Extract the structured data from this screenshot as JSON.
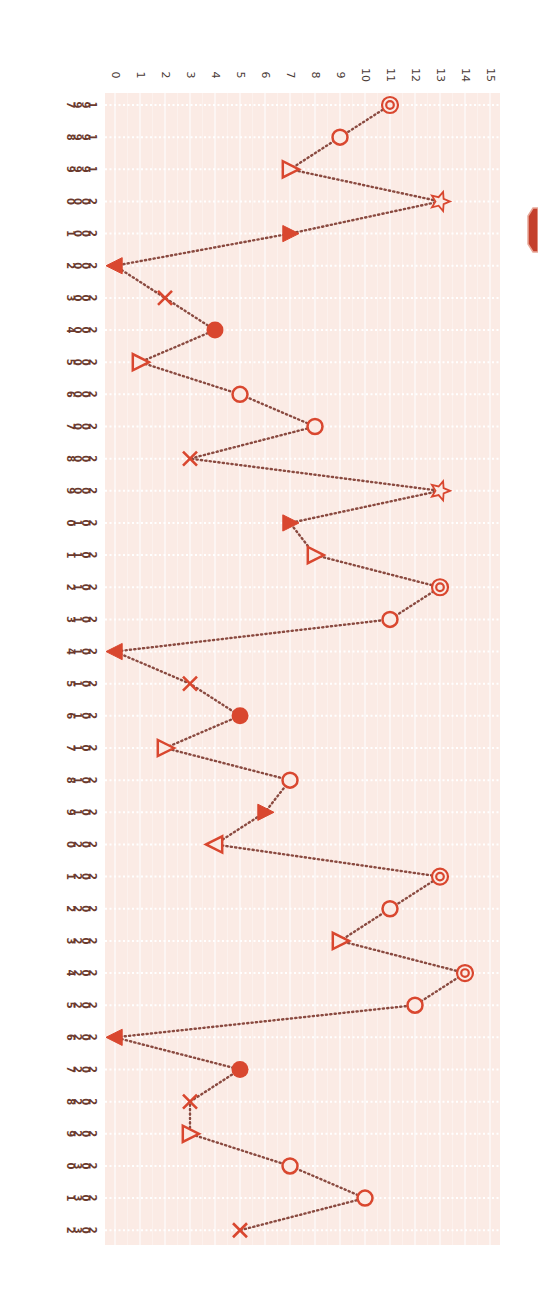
{
  "chart_data": {
    "type": "line",
    "orientation": "rotated-90-clockwise",
    "title": "",
    "xlabel": "",
    "ylabel": "",
    "ylim": [
      0,
      15
    ],
    "yticks": [
      0,
      1,
      2,
      3,
      4,
      5,
      6,
      7,
      8,
      9,
      10,
      11,
      12,
      13,
      14,
      15
    ],
    "grid": true,
    "line_style": "dotted",
    "colors": {
      "marker": "#d9472f",
      "line": "#8a4a40",
      "plot_background": "#fbebe5",
      "grid": "#ffffff",
      "tick_text": "#4a3a36",
      "year_text": "#6b3a2e",
      "badge": "#c4402c"
    },
    "x": [
      1997,
      1998,
      1999,
      2000,
      2001,
      2002,
      2003,
      2004,
      2005,
      2006,
      2007,
      2008,
      2009,
      2010,
      2011,
      2012,
      2013,
      2014,
      2015,
      2016,
      2017,
      2018,
      2019,
      2020,
      2021,
      2022,
      2023,
      2024,
      2025,
      2026,
      2027,
      2028,
      2029,
      2030,
      2031,
      2032
    ],
    "values": [
      11,
      9,
      7,
      13,
      7,
      0,
      2,
      4,
      1,
      5,
      8,
      3,
      13,
      7,
      8,
      13,
      11,
      0,
      3,
      5,
      2,
      7,
      6,
      4,
      13,
      11,
      9,
      14,
      12,
      0,
      5,
      3,
      3,
      7,
      10,
      5
    ],
    "markers": [
      "double-circle",
      "circle",
      "triangle-open-right",
      "star",
      "triangle-filled-right",
      "triangle-filled-left",
      "x",
      "filled-circle",
      "triangle-open-right",
      "circle",
      "circle",
      "x",
      "star",
      "triangle-filled-right",
      "triangle-open-right",
      "double-circle",
      "circle",
      "triangle-filled-left",
      "x",
      "filled-circle",
      "triangle-open-right",
      "circle",
      "triangle-filled-right",
      "triangle-open-left",
      "double-circle",
      "circle",
      "triangle-open-right",
      "double-circle",
      "circle",
      "triangle-filled-left",
      "filled-circle",
      "x",
      "triangle-open-right",
      "circle",
      "circle",
      "x"
    ]
  },
  "badge": {
    "icon": "octagon-icon"
  }
}
